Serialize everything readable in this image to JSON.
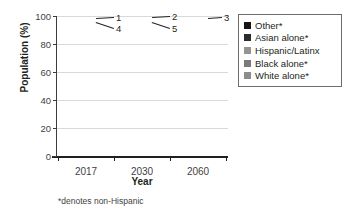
{
  "chart_data": {
    "type": "bar",
    "subtype": "stacked-bar-100",
    "title": "",
    "xlabel": "Year",
    "ylabel": "Population (%)",
    "categories": [
      "2017",
      "2030",
      "2060"
    ],
    "ylim": [
      0,
      100
    ],
    "yticks": [
      "0",
      "20",
      "40",
      "60",
      "80",
      "100"
    ],
    "grid": true,
    "legend_position": "right",
    "footnote": "*denotes non-Hispanic",
    "series": [
      {
        "name": "White alone*",
        "color": "#8c8c8c",
        "values": [
          77,
          72,
          55
        ],
        "labels": [
          "77",
          "72",
          "55"
        ],
        "label_inside": [
          true,
          true,
          true
        ]
      },
      {
        "name": "Black alone*",
        "color": "#7a7a7a",
        "values": [
          9,
          10,
          13
        ],
        "labels": [
          "9",
          "10",
          "13"
        ],
        "label_inside": [
          true,
          true,
          true
        ]
      },
      {
        "name": "Hispanic/Latinx",
        "color": "#949494",
        "values": [
          8,
          11,
          21
        ],
        "labels": [
          "8",
          "11",
          "21"
        ],
        "label_inside": [
          true,
          true,
          true
        ]
      },
      {
        "name": "Asian alone*",
        "color": "#2b2b2b",
        "values": [
          4,
          5,
          8
        ],
        "labels": [
          "4",
          "5",
          "8"
        ],
        "label_inside": [
          false,
          false,
          true
        ]
      },
      {
        "name": "Other*",
        "color": "#151515",
        "values": [
          1,
          2,
          3
        ],
        "labels": [
          "1",
          "2",
          "3"
        ],
        "label_inside": [
          false,
          false,
          false
        ]
      }
    ]
  },
  "legend": {
    "items": [
      {
        "label": "Other*",
        "color": "#151515"
      },
      {
        "label": "Asian alone*",
        "color": "#2b2b2b"
      },
      {
        "label": "Hispanic/Latinx",
        "color": "#949494"
      },
      {
        "label": "Black alone*",
        "color": "#7a7a7a"
      },
      {
        "label": "White alone*",
        "color": "#8c8c8c"
      }
    ]
  },
  "callouts": [
    {
      "text": "1",
      "group": "2017",
      "series": "Other*"
    },
    {
      "text": "4",
      "group": "2017",
      "series": "Asian alone*"
    },
    {
      "text": "2",
      "group": "2030",
      "series": "Other*"
    },
    {
      "text": "5",
      "group": "2030",
      "series": "Asian alone*"
    },
    {
      "text": "3",
      "group": "2060",
      "series": "Other*"
    }
  ]
}
